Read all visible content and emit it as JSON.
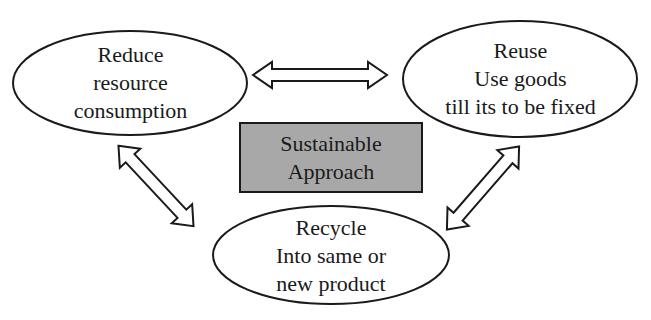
{
  "diagram": {
    "center": {
      "lines": [
        "Sustainable",
        "Approach"
      ],
      "fill": "#a8a8a8"
    },
    "reduce": {
      "lines": [
        "Reduce",
        "resource",
        "consumption"
      ]
    },
    "reuse": {
      "lines": [
        "Reuse",
        "Use goods",
        "till its to be fixed"
      ]
    },
    "recycle": {
      "lines": [
        "Recycle",
        "Into same or",
        "new product"
      ]
    },
    "arrows": [
      {
        "from": "reduce",
        "to": "reuse",
        "type": "double-headed"
      },
      {
        "from": "reduce",
        "to": "recycle",
        "type": "double-headed"
      },
      {
        "from": "reuse",
        "to": "recycle",
        "type": "double-headed"
      }
    ],
    "stroke_color": "#1a1a1a",
    "background": "#ffffff"
  }
}
